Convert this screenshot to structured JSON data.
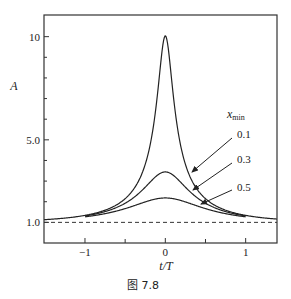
{
  "chart_data": {
    "type": "line",
    "title": "",
    "caption": "图 7.8",
    "xlabel": "t/T",
    "ylabel": "A",
    "xlim": [
      -1.51,
      1.39
    ],
    "ylim": [
      0,
      11.05
    ],
    "xticks": [
      {
        "value": -1,
        "label": "−1"
      },
      {
        "value": 0,
        "label": "0"
      },
      {
        "value": 1,
        "label": "1"
      }
    ],
    "xminor_ticks": [
      -0.5,
      0.5
    ],
    "yticks": [
      {
        "value": 1,
        "label": "1.0"
      },
      {
        "value": 5,
        "label": "5.0"
      },
      {
        "value": 10,
        "label": "10"
      }
    ],
    "yminor_ticks": [
      2,
      3,
      4,
      6,
      7,
      8,
      9
    ],
    "grid": false,
    "reference_line": {
      "y": 1.0,
      "style": "dashed"
    },
    "formula": "A(u) = (u^2+2)/(u*sqrt(u^2+4)), u = sqrt(x_min^2 + (t/T)^2)",
    "legend": {
      "title": "x",
      "title_sub": "min",
      "placement": "right"
    },
    "series": [
      {
        "name": "0.1",
        "x_min": 0.1,
        "t_range": [
          -1.51,
          1.39
        ],
        "peak": 10.04,
        "sample_points": [
          [
            -1.5,
            1.06
          ],
          [
            -1.0,
            1.13
          ],
          [
            -0.5,
            1.58
          ],
          [
            -0.3,
            2.3
          ],
          [
            -0.2,
            3.27
          ],
          [
            -0.1,
            7.1
          ],
          [
            0,
            10.04
          ],
          [
            0.1,
            7.1
          ],
          [
            0.2,
            3.27
          ],
          [
            0.3,
            2.3
          ],
          [
            0.5,
            1.58
          ],
          [
            1.0,
            1.13
          ],
          [
            1.39,
            1.05
          ]
        ]
      },
      {
        "name": "0.3",
        "x_min": 0.3,
        "t_range": [
          -1.0,
          1.0
        ],
        "peak": 3.44,
        "sample_points": [
          [
            -1.0,
            1.12
          ],
          [
            -0.5,
            1.5
          ],
          [
            -0.3,
            2.35
          ],
          [
            0,
            3.44
          ],
          [
            0.3,
            2.35
          ],
          [
            0.5,
            1.5
          ],
          [
            1.0,
            1.12
          ]
        ]
      },
      {
        "name": "0.5",
        "x_min": 0.5,
        "t_range": [
          -1.0,
          1.0
        ],
        "peak": 2.18,
        "sample_points": [
          [
            -1.0,
            1.1
          ],
          [
            -0.5,
            1.55
          ],
          [
            0,
            2.18
          ],
          [
            0.5,
            1.55
          ],
          [
            1.0,
            1.1
          ]
        ]
      }
    ]
  }
}
